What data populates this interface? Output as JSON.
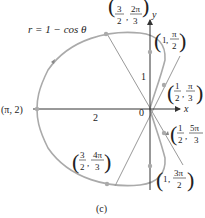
{
  "figure": {
    "equation": "r = 1 − cos θ",
    "caption": "(c)",
    "axis_x": "x",
    "axis_y": "y",
    "origin_label": "0",
    "label_two": "2",
    "label_one": "1",
    "points": [
      {
        "r": "(π, 2)"
      },
      {
        "r_num": "3",
        "r_den": "2",
        "t_num": "2π",
        "t_den": "3"
      },
      {
        "r": "1",
        "t_num": "π",
        "t_den": "2"
      },
      {
        "r_num": "1",
        "r_den": "2",
        "t_num": "π",
        "t_den": "3"
      },
      {
        "r_num": "1",
        "r_den": "2",
        "t_num": "5π",
        "t_den": "3"
      },
      {
        "r_num": "3",
        "r_den": "2",
        "t_num": "4π",
        "t_den": "3"
      },
      {
        "r": "1",
        "t_num": "3π",
        "t_den": "2"
      }
    ],
    "colors": {
      "curve": "#aaaaaa",
      "axis": "#333333",
      "ray": "#999999"
    }
  }
}
